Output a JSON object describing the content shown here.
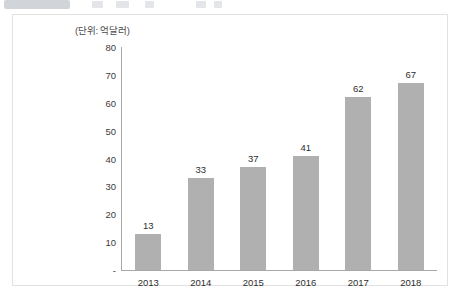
{
  "header": {
    "badge_label": "",
    "ghost_items": [
      "",
      "",
      "",
      "",
      ""
    ]
  },
  "chart_panel": {
    "unit_label": "(단위: 억달러)"
  },
  "chart_data": {
    "type": "bar",
    "title": "",
    "subtitle": "",
    "unit_note": "(단위: 억달러)",
    "categories": [
      "2013",
      "2014",
      "2015",
      "2016",
      "2017",
      "2018"
    ],
    "values": [
      13,
      33,
      37,
      41,
      62,
      67
    ],
    "series": [
      {
        "name": "",
        "values": [
          13,
          33,
          37,
          41,
          62,
          67
        ]
      }
    ],
    "xlabel": "",
    "ylabel": "",
    "ylim": [
      0,
      80
    ],
    "ytick_labels": [
      "-",
      "10",
      "20",
      "30",
      "40",
      "50",
      "60",
      "70",
      "80"
    ],
    "ytick_values": [
      0,
      10,
      20,
      30,
      40,
      50,
      60,
      70,
      80
    ],
    "grid": false,
    "legend": false,
    "legend_position": "none",
    "bar_color": "#b0b0b0",
    "axis_color": "#a8a8a8",
    "data_labels": [
      "13",
      "33",
      "37",
      "41",
      "62",
      "67"
    ]
  }
}
